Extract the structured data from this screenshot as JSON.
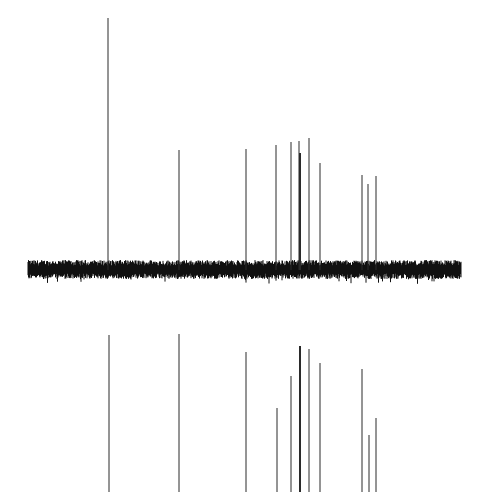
{
  "chart_data": [
    {
      "type": "bar",
      "title": "",
      "xlabel": "",
      "ylabel": "",
      "description": "Upper panel: 1D NMR-style stick spectrum with a noisy baseline",
      "grid": false,
      "legend": null,
      "baseline": {
        "x_start_px": 28,
        "x_end_px": 461,
        "y_center_px": 270,
        "noise_amplitude_px": 9
      },
      "peaks": [
        {
          "x_px": 108,
          "top_px": 18,
          "thick": false
        },
        {
          "x_px": 179,
          "top_px": 150,
          "thick": false
        },
        {
          "x_px": 246,
          "top_px": 149,
          "thick": false
        },
        {
          "x_px": 276,
          "top_px": 145,
          "thick": false
        },
        {
          "x_px": 291,
          "top_px": 142,
          "thick": false
        },
        {
          "x_px": 299,
          "top_px": 141,
          "thick": false
        },
        {
          "x_px": 300,
          "top_px": 153,
          "thick": true
        },
        {
          "x_px": 309,
          "top_px": 138,
          "thick": false
        },
        {
          "x_px": 320,
          "top_px": 163,
          "thick": false
        },
        {
          "x_px": 362,
          "top_px": 175,
          "thick": false
        },
        {
          "x_px": 368,
          "top_px": 184,
          "thick": false
        },
        {
          "x_px": 376,
          "top_px": 176,
          "thick": false
        }
      ]
    },
    {
      "type": "bar",
      "title": "",
      "xlabel": "",
      "ylabel": "",
      "description": "Lower panel: stick spectrum (e.g. DEPT-style), lines extending to bottom edge, no baseline visible",
      "grid": false,
      "legend": null,
      "bottom_px": 492,
      "peaks": [
        {
          "x_px": 109,
          "top_px": 335,
          "thick": false
        },
        {
          "x_px": 179,
          "top_px": 334,
          "thick": false
        },
        {
          "x_px": 246,
          "top_px": 352,
          "thick": false
        },
        {
          "x_px": 277,
          "top_px": 408,
          "thick": false
        },
        {
          "x_px": 291,
          "top_px": 376,
          "thick": false
        },
        {
          "x_px": 300,
          "top_px": 346,
          "thick": true
        },
        {
          "x_px": 309,
          "top_px": 349,
          "thick": false
        },
        {
          "x_px": 320,
          "top_px": 363,
          "thick": false
        },
        {
          "x_px": 362,
          "top_px": 369,
          "thick": false
        },
        {
          "x_px": 369,
          "top_px": 435,
          "thick": false
        },
        {
          "x_px": 376,
          "top_px": 418,
          "thick": false
        }
      ]
    }
  ],
  "colors": {
    "line": "#2a2a2a",
    "baseline": "#111111",
    "background": "#ffffff"
  }
}
